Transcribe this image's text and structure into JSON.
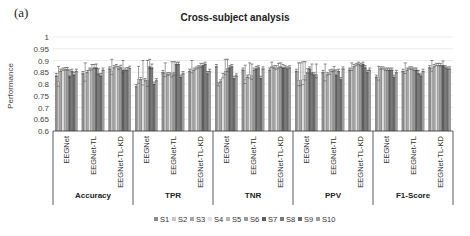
{
  "panel_label": "(a)",
  "chart_data": {
    "type": "bar",
    "title": "Cross-subject analysis",
    "xlabel": "",
    "ylabel": "Performance",
    "ylim": [
      0.6,
      1.0
    ],
    "yticks": [
      "0.6",
      "0.65",
      "0.7",
      "0.75",
      "0.8",
      "0.85",
      "0.9",
      "0.95",
      "1"
    ],
    "grid": true,
    "legend_position": "bottom",
    "metrics": [
      "Accuracy",
      "TPR",
      "TNR",
      "PPV",
      "F1-Score"
    ],
    "models": [
      "EEGNet",
      "EEGNet-TL",
      "EEGNet-TL-KD"
    ],
    "series_names": [
      "S1",
      "S2",
      "S3",
      "S4",
      "S5",
      "S6",
      "S7",
      "S8",
      "S9",
      "S10"
    ],
    "series_colors": [
      "#8c8c8c",
      "#c8c8c8",
      "#a6a6a6",
      "#e0e0e0",
      "#b4b4b4",
      "#9a9a9a",
      "#5e5e5e",
      "#7a7a7a",
      "#6a6a6a",
      "#9e9e9e"
    ],
    "groups": [
      {
        "metric": "Accuracy",
        "model": "EEGNet",
        "values": [
          0.835,
          0.81,
          0.855,
          0.86,
          0.862,
          0.862,
          0.835,
          0.855,
          0.84,
          0.855
        ],
        "errors": [
          0.01,
          0.065,
          0.008,
          0.008,
          0.008,
          0.008,
          0.025,
          0.008,
          0.01,
          0.008
        ]
      },
      {
        "metric": "Accuracy",
        "model": "EEGNet-TL",
        "values": [
          0.845,
          0.83,
          0.85,
          0.86,
          0.865,
          0.87,
          0.87,
          0.845,
          0.835,
          0.86
        ],
        "errors": [
          0.008,
          0.06,
          0.008,
          0.008,
          0.018,
          0.013,
          0.015,
          0.02,
          0.01,
          0.008
        ]
      },
      {
        "metric": "Accuracy",
        "model": "EEGNet-TL-KD",
        "values": [
          0.865,
          0.855,
          0.87,
          0.875,
          0.865,
          0.87,
          0.86,
          0.86,
          0.86,
          0.868
        ],
        "errors": [
          0.008,
          0.05,
          0.008,
          0.008,
          0.01,
          0.01,
          0.04,
          0.008,
          0.01,
          0.008
        ]
      },
      {
        "metric": "TPR",
        "model": "EEGNet",
        "values": [
          0.79,
          0.82,
          0.82,
          0.82,
          0.815,
          0.815,
          0.875,
          0.87,
          0.8,
          0.815
        ],
        "errors": [
          0.008,
          0.055,
          0.008,
          0.08,
          0.008,
          0.085,
          0.03,
          0.015,
          0.008,
          0.008
        ]
      },
      {
        "metric": "TPR",
        "model": "EEGNet-TL",
        "values": [
          0.85,
          0.845,
          0.84,
          0.84,
          0.845,
          0.85,
          0.885,
          0.885,
          0.83,
          0.845
        ],
        "errors": [
          0.008,
          0.045,
          0.008,
          0.008,
          0.05,
          0.045,
          0.008,
          0.008,
          0.008,
          0.008
        ]
      },
      {
        "metric": "TPR",
        "model": "EEGNet-TL-KD",
        "values": [
          0.855,
          0.86,
          0.86,
          0.865,
          0.87,
          0.875,
          0.88,
          0.885,
          0.845,
          0.855
        ],
        "errors": [
          0.008,
          0.04,
          0.008,
          0.008,
          0.008,
          0.013,
          0.008,
          0.008,
          0.008,
          0.008
        ]
      },
      {
        "metric": "TNR",
        "model": "EEGNet",
        "values": [
          0.875,
          0.795,
          0.81,
          0.83,
          0.855,
          0.865,
          0.87,
          0.875,
          0.825,
          0.835
        ],
        "errors": [
          0.008,
          0.01,
          0.008,
          0.015,
          0.05,
          0.04,
          0.008,
          0.008,
          0.008,
          0.008
        ]
      },
      {
        "metric": "TNR",
        "model": "EEGNet-TL",
        "values": [
          0.86,
          0.82,
          0.83,
          0.84,
          0.835,
          0.86,
          0.865,
          0.87,
          0.825,
          0.865
        ],
        "errors": [
          0.008,
          0.06,
          0.008,
          0.05,
          0.05,
          0.008,
          0.01,
          0.008,
          0.008,
          0.008
        ]
      },
      {
        "metric": "TNR",
        "model": "EEGNet-TL-KD",
        "values": [
          0.86,
          0.875,
          0.87,
          0.865,
          0.87,
          0.875,
          0.87,
          0.87,
          0.865,
          0.87
        ],
        "errors": [
          0.008,
          0.018,
          0.008,
          0.013,
          0.018,
          0.015,
          0.013,
          0.008,
          0.008,
          0.008
        ]
      },
      {
        "metric": "PPV",
        "model": "EEGNet",
        "values": [
          0.855,
          0.815,
          0.815,
          0.82,
          0.835,
          0.85,
          0.865,
          0.85,
          0.84,
          0.84
        ],
        "errors": [
          0.008,
          0.075,
          0.075,
          0.075,
          0.06,
          0.015,
          0.008,
          0.035,
          0.008,
          0.045
        ]
      },
      {
        "metric": "PPV",
        "model": "EEGNet-TL",
        "values": [
          0.85,
          0.83,
          0.84,
          0.845,
          0.855,
          0.86,
          0.84,
          0.855,
          0.82,
          0.865
        ],
        "errors": [
          0.008,
          0.055,
          0.008,
          0.015,
          0.008,
          0.015,
          0.02,
          0.008,
          0.008,
          0.008
        ]
      },
      {
        "metric": "PPV",
        "model": "EEGNet-TL-KD",
        "values": [
          0.86,
          0.865,
          0.875,
          0.88,
          0.885,
          0.88,
          0.885,
          0.87,
          0.85,
          0.86
        ],
        "errors": [
          0.008,
          0.025,
          0.008,
          0.008,
          0.008,
          0.008,
          0.008,
          0.008,
          0.008,
          0.008
        ]
      },
      {
        "metric": "F1-Score",
        "model": "EEGNet",
        "values": [
          0.83,
          0.83,
          0.865,
          0.865,
          0.86,
          0.86,
          0.86,
          0.86,
          0.83,
          0.85
        ],
        "errors": [
          0.008,
          0.045,
          0.008,
          0.008,
          0.008,
          0.008,
          0.008,
          0.008,
          0.008,
          0.008
        ]
      },
      {
        "metric": "F1-Score",
        "model": "EEGNet-TL",
        "values": [
          0.855,
          0.855,
          0.86,
          0.865,
          0.865,
          0.86,
          0.86,
          0.845,
          0.835,
          0.855
        ],
        "errors": [
          0.008,
          0.035,
          0.008,
          0.008,
          0.008,
          0.008,
          0.008,
          0.013,
          0.008,
          0.008
        ]
      },
      {
        "metric": "F1-Score",
        "model": "EEGNet-TL-KD",
        "values": [
          0.87,
          0.865,
          0.875,
          0.88,
          0.88,
          0.88,
          0.88,
          0.87,
          0.865,
          0.865
        ],
        "errors": [
          0.008,
          0.035,
          0.008,
          0.008,
          0.008,
          0.008,
          0.018,
          0.008,
          0.008,
          0.008
        ]
      }
    ]
  }
}
